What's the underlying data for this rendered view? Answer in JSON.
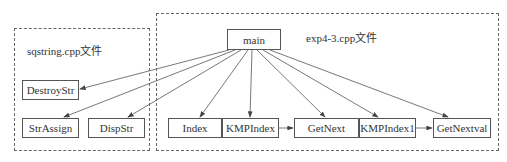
{
  "groups": {
    "sqstring": {
      "label": "sqstring.cpp文件"
    },
    "exp": {
      "label": "exp4-3.cpp文件"
    }
  },
  "nodes": {
    "main": "main",
    "destroystr": "DestroyStr",
    "strassign": "StrAssign",
    "dispstr": "DispStr",
    "index": "Index",
    "kmpindex": "KMPIndex",
    "getnext": "GetNext",
    "kmpindex1": "KMPIndex1",
    "getnextval": "GetNextval"
  },
  "edges": [
    [
      "main",
      "DestroyStr"
    ],
    [
      "main",
      "StrAssign"
    ],
    [
      "main",
      "DispStr"
    ],
    [
      "main",
      "Index"
    ],
    [
      "main",
      "KMPIndex"
    ],
    [
      "main",
      "GetNext"
    ],
    [
      "main",
      "KMPIndex1"
    ],
    [
      "main",
      "GetNextval"
    ],
    [
      "KMPIndex",
      "GetNext"
    ],
    [
      "KMPIndex1",
      "GetNextval"
    ]
  ]
}
